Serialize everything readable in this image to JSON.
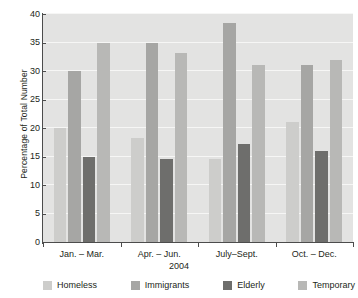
{
  "chart_data": {
    "type": "bar",
    "title": "",
    "xlabel": "2004",
    "ylabel": "Percentage of Total Number",
    "categories": [
      "Jan. – Mar.",
      "Apr. – Jun.",
      "July–Sept.",
      "Oct. – Dec."
    ],
    "series": [
      {
        "name": "Homeless",
        "color": "#cdcdcb",
        "values": [
          20,
          18.3,
          14.5,
          21
        ]
      },
      {
        "name": "Immigrants",
        "color": "#a6a6a4",
        "values": [
          30,
          35,
          38.5,
          31
        ]
      },
      {
        "name": "Elderly",
        "color": "#6e6e6c",
        "values": [
          15,
          14.5,
          17.2,
          16
        ]
      },
      {
        "name": "Temporary",
        "color": "#b8b8b6",
        "values": [
          35,
          33.2,
          31,
          32
        ]
      }
    ],
    "ylim": [
      0,
      40
    ],
    "yticks": [
      0,
      5,
      10,
      15,
      20,
      25,
      30,
      35,
      40
    ],
    "ytick_labels": [
      "0",
      "5",
      "10",
      "15",
      "20",
      "25",
      "30",
      "35",
      "40"
    ],
    "grid": true,
    "legend_position": "bottom",
    "plot_background": "#e3e3e2",
    "gridline_color": "#f6f6f5",
    "axis_color": "#4c4c4c"
  }
}
